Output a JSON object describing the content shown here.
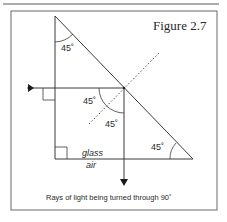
{
  "figure": {
    "title": "Figure 2.7",
    "caption": "Rays of light being turned through 90˚",
    "angles": {
      "top": "45˚",
      "incident": "45˚",
      "reflected": "45˚",
      "bottom_right": "45˚"
    },
    "media": {
      "upper": "glass",
      "lower": "air"
    }
  },
  "colors": {
    "line": "#3a3a3a",
    "frame": "#6a6a6a",
    "background": "#ffffff"
  }
}
